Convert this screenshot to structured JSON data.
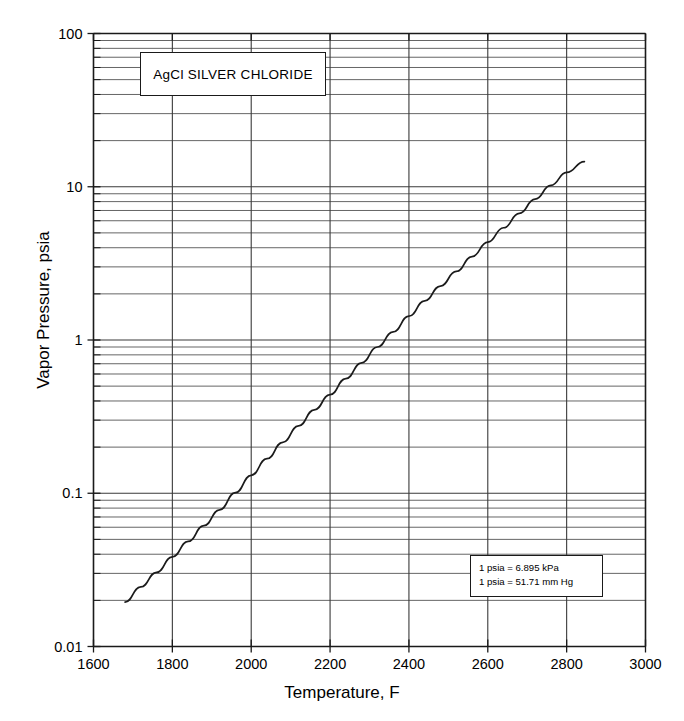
{
  "chart_data": {
    "type": "line",
    "title": "AgCl  SILVER  CHLORIDE",
    "xlabel": "Temperature, F",
    "ylabel": "Vapor Pressure, psia",
    "xscale": "linear",
    "yscale": "log",
    "xlim": [
      1600,
      3000
    ],
    "ylim": [
      0.01,
      100
    ],
    "grid": true,
    "legend": "none",
    "x_ticks": [
      1600,
      1800,
      2000,
      2200,
      2400,
      2600,
      2800,
      3000
    ],
    "x_tick_labels": [
      "1600",
      "1800",
      "2000",
      "2200",
      "2400",
      "2600",
      "2800",
      "3000"
    ],
    "y_ticks": [
      0.01,
      0.1,
      1,
      10,
      100
    ],
    "y_tick_labels": [
      "0.01",
      "0.1",
      "1",
      "10",
      "100"
    ],
    "y_minor_multipliers": [
      2,
      3,
      4,
      5,
      6,
      7,
      8,
      9
    ],
    "series": [
      {
        "name": "AgCl vapor pressure",
        "x": [
          1680,
          1720,
          1760,
          1800,
          1840,
          1880,
          1920,
          1960,
          2000,
          2040,
          2080,
          2120,
          2160,
          2200,
          2240,
          2280,
          2320,
          2360,
          2400,
          2440,
          2480,
          2520,
          2560,
          2600,
          2640,
          2680,
          2720,
          2760,
          2800,
          2845
        ],
        "y": [
          0.0195,
          0.0245,
          0.0305,
          0.0385,
          0.0485,
          0.0615,
          0.078,
          0.101,
          0.131,
          0.168,
          0.215,
          0.275,
          0.35,
          0.44,
          0.56,
          0.71,
          0.9,
          1.13,
          1.43,
          1.8,
          2.25,
          2.8,
          3.5,
          4.35,
          5.4,
          6.7,
          8.3,
          10.2,
          12.4,
          14.6
        ]
      }
    ],
    "annotations": [
      {
        "name": "title-box",
        "text": "AgCl  SILVER  CHLORIDE"
      },
      {
        "name": "conversion-box",
        "lines": [
          "1 psia = 6.895 kPa",
          "1 psia = 51.71 mm Hg"
        ]
      }
    ]
  },
  "chart": {
    "title_box": {
      "label": "AgCl  SILVER  CHLORIDE"
    },
    "conversion_box": {
      "line1": "1 psia = 6.895 kPa",
      "line2": "1 psia = 51.71 mm Hg"
    },
    "axes": {
      "x_title": "Temperature, F",
      "y_title": "Vapor Pressure, psia"
    }
  },
  "colors": {
    "curve": "#1b1b1b",
    "axis": "#1a1a1a",
    "grid_major": "#3a3a3a",
    "grid_minor": "#4a4a4a",
    "background": "#ffffff"
  }
}
